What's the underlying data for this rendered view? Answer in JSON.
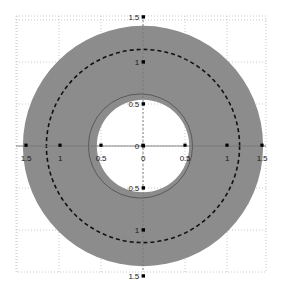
{
  "figure": {
    "title": "",
    "background_color": "#ffffff",
    "plot_area": {
      "left": 16,
      "top": 16,
      "right": 266,
      "bottom": 272,
      "border_color": "#c8c8c8",
      "border_style": "dotted"
    },
    "center_px": {
      "x": 143,
      "y": 146
    },
    "scale_px_per_unit": 84
  },
  "chart_data": {
    "type": "scatter",
    "title": "",
    "xlabel": "",
    "ylabel": "",
    "xlim": [
      -1.5,
      1.5
    ],
    "ylim": [
      -1.5,
      1.5
    ],
    "grid": true,
    "grid_color": "#bdbdbd",
    "grid_style": "dotted",
    "x_ticks": [
      -1.5,
      -1,
      -0.5,
      0,
      0.5,
      1,
      1.5
    ],
    "x_tick_labels": [
      "1.5",
      "1",
      "0.5",
      "0",
      "0.5",
      "1",
      "1.5"
    ],
    "y_ticks": [
      -1.5,
      -1,
      -0.5,
      0,
      0.5,
      1,
      1.5
    ],
    "y_tick_labels": [
      "1.5",
      "1",
      "0.5",
      "0",
      "0.5",
      "1",
      "1.5"
    ],
    "tick_marker": "square",
    "tick_marker_color": "#000000",
    "series": [
      {
        "name": "filled-annulus",
        "shape": "annulus",
        "center": [
          0.0,
          0.0
        ],
        "inner_radius": 0.55,
        "outer_radius": 1.43,
        "fill": "#8c8c8c",
        "stroke": "none"
      },
      {
        "name": "dashed-circle",
        "shape": "circle",
        "center": [
          0.0,
          0.0
        ],
        "radius": 1.15,
        "fill": "none",
        "stroke": "#111111",
        "stroke_width": 1.6,
        "dash": "4 3"
      },
      {
        "name": "thin-solid-circle",
        "shape": "circle",
        "center": [
          -0.03,
          0.0
        ],
        "radius": 0.62,
        "fill": "none",
        "stroke": "#4d4d4d",
        "stroke_width": 0.8,
        "dash": "none"
      }
    ],
    "annotations": []
  },
  "axis": {
    "x_axis_line_color": "#777777",
    "y_axis_line_color": "#777777",
    "x_labels": [
      {
        "text": "1.5",
        "x_px": 26,
        "y_px": 158
      },
      {
        "text": "1",
        "x_px": 60,
        "y_px": 158
      },
      {
        "text": "0.5",
        "x_px": 101,
        "y_px": 158
      },
      {
        "text": "0",
        "x_px": 143,
        "y_px": 158
      },
      {
        "text": "0.5",
        "x_px": 185,
        "y_px": 158
      },
      {
        "text": "1",
        "x_px": 227,
        "y_px": 158
      },
      {
        "text": "1.5",
        "x_px": 262,
        "y_px": 158
      }
    ],
    "y_labels": [
      {
        "text": "1.5",
        "x_px": 139,
        "y_px": 17
      },
      {
        "text": "1",
        "x_px": 139,
        "y_px": 62
      },
      {
        "text": "0.5",
        "x_px": 139,
        "y_px": 104
      },
      {
        "text": "0",
        "x_px": 139,
        "y_px": 146
      },
      {
        "text": "0.5",
        "x_px": 139,
        "y_px": 188
      },
      {
        "text": "1",
        "x_px": 139,
        "y_px": 230
      },
      {
        "text": "1.5",
        "x_px": 139,
        "y_px": 276
      }
    ]
  }
}
